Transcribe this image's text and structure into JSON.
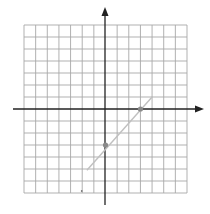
{
  "chart_data": {
    "type": "line",
    "title": "",
    "xlabel": "",
    "ylabel": "",
    "grid": true,
    "xlim": [
      -7,
      7
    ],
    "ylim": [
      -7,
      7
    ],
    "grid_cells": {
      "x": 14,
      "y": 14
    },
    "series": [
      {
        "name": "line",
        "equation": "y = x - 3",
        "segment": {
          "x": [
            -1.6,
            4
          ],
          "y": [
            -5.1,
            1
          ]
        },
        "color": "#b8b8b8"
      }
    ],
    "points": [
      {
        "x": 3,
        "y": 0,
        "label": ""
      },
      {
        "x": 0,
        "y": -3,
        "label": ""
      }
    ],
    "stray_mark": {
      "x": -2,
      "y": -7
    },
    "colors": {
      "grid": "#a8a8a8",
      "axis": "#222222",
      "point": "#8a8a8a",
      "line": "#c0c0c0"
    }
  }
}
